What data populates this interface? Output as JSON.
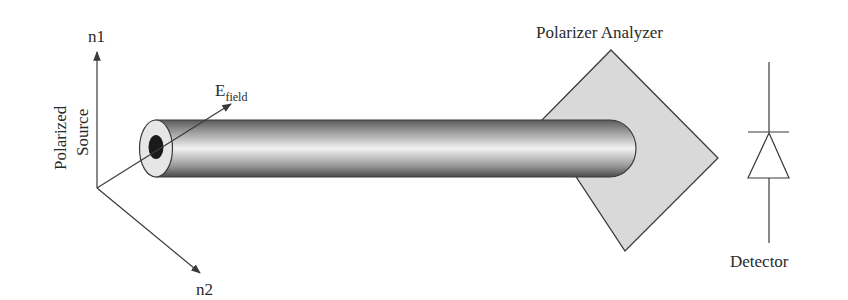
{
  "diagram": {
    "type": "optical setup schematic",
    "labels": {
      "axis_n1": "n1",
      "axis_n2": "n2",
      "source": [
        "Polarized",
        "Source"
      ],
      "efield_main": "E",
      "efield_sub": "field",
      "analyzer": "Polarizer Analyzer",
      "detector": "Detector"
    },
    "components": [
      {
        "id": "polarized-source",
        "label": "Polarized Source"
      },
      {
        "id": "optical-fiber",
        "label": ""
      },
      {
        "id": "polarizer-analyzer",
        "label": "Polarizer Analyzer"
      },
      {
        "id": "detector",
        "label": "Detector"
      }
    ],
    "colors": {
      "line": "#3a3a3a",
      "analyzer_fill": "#d9d9d9",
      "fiber_core": "#1a1a1a",
      "fiber_cladding": "#e6e6e6"
    }
  }
}
